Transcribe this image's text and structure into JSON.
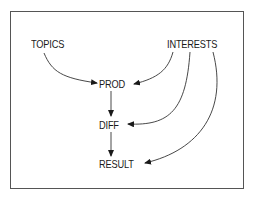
{
  "diagram": {
    "nodes": {
      "topics": "TOPICS",
      "interests": "INTERESTS",
      "prod": "PROD",
      "diff": "DIFF",
      "result": "RESULT"
    },
    "edges": [
      {
        "from": "TOPICS",
        "to": "PROD"
      },
      {
        "from": "INTERESTS",
        "to": "PROD"
      },
      {
        "from": "INTERESTS",
        "to": "DIFF"
      },
      {
        "from": "INTERESTS",
        "to": "RESULT"
      },
      {
        "from": "PROD",
        "to": "DIFF"
      },
      {
        "from": "DIFF",
        "to": "RESULT"
      }
    ]
  }
}
